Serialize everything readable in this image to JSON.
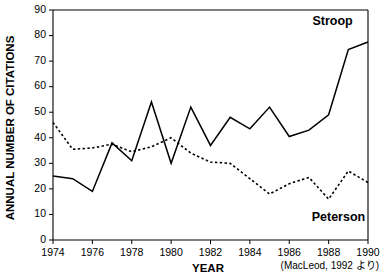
{
  "chart_data": {
    "type": "line",
    "title": "",
    "xlabel": "YEAR",
    "ylabel": "ANNUAL NUMBER OF CITATIONS",
    "xlim": [
      1974,
      1990
    ],
    "ylim": [
      0,
      90
    ],
    "grid": false,
    "legend_position": "inline-annotation",
    "x": [
      1974,
      1975,
      1976,
      1977,
      1978,
      1979,
      1980,
      1981,
      1982,
      1983,
      1984,
      1985,
      1986,
      1987,
      1988,
      1989,
      1990
    ],
    "xticks": [
      1974,
      1976,
      1978,
      1980,
      1982,
      1984,
      1986,
      1988,
      1990
    ],
    "xtick_labels": [
      "1974",
      "1976",
      "1978",
      "1980",
      "1982",
      "1984",
      "1986",
      "1988",
      "1990"
    ],
    "yticks": [
      0,
      10,
      20,
      30,
      40,
      50,
      60,
      70,
      80,
      90
    ],
    "ytick_labels": [
      "0",
      "10",
      "20",
      "30",
      "40",
      "50",
      "60",
      "70",
      "80",
      "90"
    ],
    "series": [
      {
        "name": "Stroop",
        "style": "solid",
        "color": "#000000",
        "values": [
          25,
          24,
          19,
          38,
          31,
          54,
          30,
          52,
          37,
          48,
          43.5,
          52,
          40.5,
          43,
          49,
          74.5,
          77.5
        ]
      },
      {
        "name": "Peterson",
        "style": "dotted",
        "color": "#000000",
        "values": [
          46,
          35.5,
          36,
          37.5,
          34.5,
          36.5,
          40,
          34,
          30.5,
          30,
          24,
          18,
          22,
          24.5,
          16,
          27,
          22.5
        ]
      }
    ],
    "annotations": [
      {
        "name": "stroop-label",
        "text": "Stroop",
        "x": 1988.2,
        "y": 84
      },
      {
        "name": "peterson-label",
        "text": "Peterson",
        "x": 1988.5,
        "y": 7.5
      }
    ],
    "source_note": "(MacLeod, 1992 より)"
  }
}
